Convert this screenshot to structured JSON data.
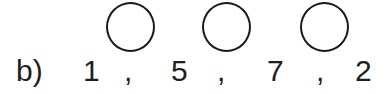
{
  "exercise": {
    "label": "b)",
    "numbers": [
      "1",
      "5",
      "7",
      "2"
    ],
    "separators": [
      ",",
      ",",
      ","
    ],
    "blank_circles": 3
  }
}
